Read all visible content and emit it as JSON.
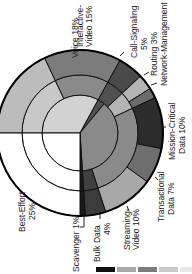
{
  "chart_data": {
    "type": "pie",
    "title": "",
    "orientation": "rotated 90deg (text reads bottom-to-top)",
    "rings": [
      {
        "name": "4-class model",
        "slices": [
          {
            "label": "Realtime",
            "value": 33,
            "color": "#d2d2d2"
          },
          {
            "label": "Control",
            "value": 3,
            "color": "#505050"
          },
          {
            "label": "Critical Data",
            "value": 38,
            "color": "#8a8a8a"
          },
          {
            "label": "Scavenger",
            "value": 1,
            "color": "#1a1a1a"
          },
          {
            "label": "Best-Effort",
            "value": 25,
            "color": "#ffffff"
          }
        ]
      },
      {
        "name": "8-class model",
        "slices": [
          {
            "label": "Voice",
            "value": 18,
            "color": "#c8c8c8"
          },
          {
            "label": "Video",
            "value": 15,
            "color": "#8a8a8a"
          },
          {
            "label": "Call-Signaling",
            "value": 5,
            "color": "#505050"
          },
          {
            "label": "Network Control",
            "value": 5,
            "color": "#b4b4b4"
          },
          {
            "label": "Critical Data",
            "value": 27,
            "color": "#8a8a8a"
          },
          {
            "label": "Bulk Data",
            "value": 4,
            "color": "#404040"
          },
          {
            "label": "Scavenger",
            "value": 1,
            "color": "#1a1a1a"
          },
          {
            "label": "Best-Effort",
            "value": 25,
            "color": "#ffffff"
          }
        ]
      },
      {
        "name": "12-class model",
        "slices": [
          {
            "label": "Voice",
            "value": 18,
            "color": "#bcbcbc"
          },
          {
            "label": "Interactive-Video",
            "value": 15,
            "color": "#7c7c7c"
          },
          {
            "label": "Call-Signaling",
            "value": 5,
            "color": "#4a4a4a"
          },
          {
            "label": "Routing",
            "value": 3,
            "color": "#b4b4b4"
          },
          {
            "label": "Network-Management",
            "value": 2,
            "color": "#6c6c6c"
          },
          {
            "label": "Mission-Critical Data",
            "value": 10,
            "color": "#2c2c2c"
          },
          {
            "label": "Transactional Data",
            "value": 7,
            "color": "#6e6e6e"
          },
          {
            "label": "Streaming-Video",
            "value": 10,
            "color": "#a8a8a8"
          },
          {
            "label": "Bulk Data",
            "value": 4,
            "color": "#3c3c3c"
          },
          {
            "label": "Scavenger",
            "value": 1,
            "color": "#1a1a1a"
          },
          {
            "label": "Best-Effort",
            "value": 25,
            "color": "#ffffff"
          }
        ]
      }
    ],
    "legend": {
      "swatches": [
        "#111111",
        "#a8a8a8",
        "#7c7c7c",
        "#c8c8c8",
        "#e8e8e8"
      ],
      "position": "bottom"
    }
  },
  "labels": {
    "voice": "Voice 18%",
    "interactive_video_1": "Interactive-",
    "interactive_video_2": "Video 15%",
    "call_signaling_1": "Call-Signaling",
    "call_signaling_2": "5%",
    "routing": "Routing 3%",
    "network_management": "Network-Management",
    "mission_critical_1": "Mission-Critical",
    "mission_critical_2": "Data 10%",
    "transactional_1": "Transactional",
    "transactional_2": "Data 7%",
    "streaming_1": "Streaming-",
    "streaming_2": "Video 10%",
    "bulk_1": "Bulk Data",
    "bulk_2": "4%",
    "scavenger": "Scavenger 1%",
    "best_effort_1": "Best-Effort",
    "best_effort_2": "25%"
  }
}
